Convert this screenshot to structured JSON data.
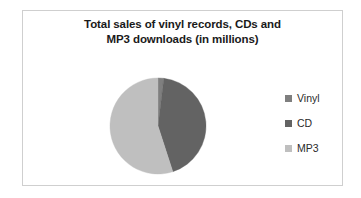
{
  "chart_data": {
    "type": "pie",
    "title": "Total sales of vinyl records, CDs and MP3 downloads (in millions)",
    "title_lines": [
      "Total sales of vinyl records, CDs and",
      "MP3 downloads (in millions)"
    ],
    "categories": [
      "Vinyl",
      "CD",
      "MP3"
    ],
    "values": [
      2,
      43,
      55
    ],
    "unit": "millions",
    "legend_position": "right",
    "grid": false,
    "xlabel": "",
    "ylabel": "",
    "colors": {
      "Vinyl": "#7f7f7f",
      "CD": "#636363",
      "MP3": "#bfbfbf"
    },
    "slices": [
      {
        "label": "Vinyl",
        "value": 2,
        "color": "#7f7f7f",
        "start_angle": 0,
        "end_angle": 7
      },
      {
        "label": "CD",
        "value": 43,
        "color": "#636363",
        "start_angle": 7,
        "end_angle": 162
      },
      {
        "label": "MP3",
        "value": 55,
        "color": "#bfbfbf",
        "start_angle": 162,
        "end_angle": 360
      }
    ]
  },
  "legend": {
    "items": [
      {
        "label": "Vinyl",
        "color": "#7f7f7f"
      },
      {
        "label": "CD",
        "color": "#636363"
      },
      {
        "label": "MP3",
        "color": "#bfbfbf"
      }
    ]
  },
  "frame": {
    "border_color": "#cfcfcf",
    "background": "#ffffff"
  }
}
